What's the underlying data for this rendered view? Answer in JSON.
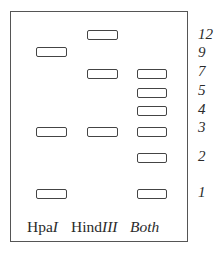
{
  "figure": {
    "type": "restriction-digest-gel",
    "lanes": [
      {
        "name": "HpaI",
        "prefix": "Hpa",
        "suffix": "I",
        "bands_kb": [
          9,
          3,
          1
        ]
      },
      {
        "name": "HindIII",
        "prefix": "Hind",
        "suffix": "III",
        "bands_kb": [
          12,
          7,
          3
        ]
      },
      {
        "name": "Both",
        "prefix": "",
        "suffix": "Both",
        "bands_kb": [
          7,
          5,
          4,
          3,
          2,
          1
        ]
      }
    ],
    "size_markers": [
      "12",
      "9",
      "7",
      "5",
      "4",
      "3",
      "2",
      "1"
    ]
  }
}
